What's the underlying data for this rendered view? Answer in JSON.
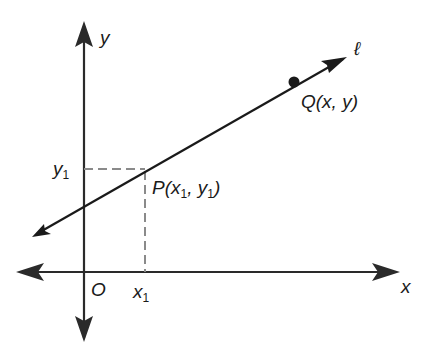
{
  "diagram": {
    "colors": {
      "axis": "#2a2a2a",
      "line": "#1a1a1a",
      "dashed": "#8a8a8a",
      "point": "#1a1a1a",
      "background": "#ffffff"
    },
    "axes": {
      "x_label": "x",
      "y_label": "y",
      "origin_label": "O"
    },
    "line": {
      "label": "ℓ"
    },
    "points": {
      "P": {
        "name": "P",
        "open": "(",
        "x_var": "x",
        "x_sub": "1",
        "sep": ", ",
        "y_var": "y",
        "y_sub": "1",
        "close": ")"
      },
      "Q": {
        "text": "Q(x, y)"
      }
    },
    "ticks": {
      "x1_var": "x",
      "x1_sub": "1",
      "y1_var": "y",
      "y1_sub": "1"
    }
  }
}
